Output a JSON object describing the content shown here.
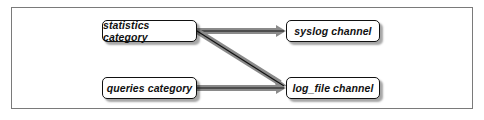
{
  "diagram": {
    "type": "flow",
    "nodes": [
      {
        "id": "statistics",
        "label": "statistics category"
      },
      {
        "id": "queries",
        "label": "queries category"
      },
      {
        "id": "syslog",
        "label": "syslog channel"
      },
      {
        "id": "log_file",
        "label": "log_file channel"
      }
    ],
    "edges": [
      {
        "from": "statistics",
        "to": "syslog"
      },
      {
        "from": "statistics",
        "to": "log_file"
      },
      {
        "from": "queries",
        "to": "log_file"
      }
    ],
    "colors": {
      "arrow_shaft": "#8a8a8a",
      "arrow_line": "#111111",
      "node_border": "#111111",
      "frame_border": "#7a7a7a"
    }
  }
}
